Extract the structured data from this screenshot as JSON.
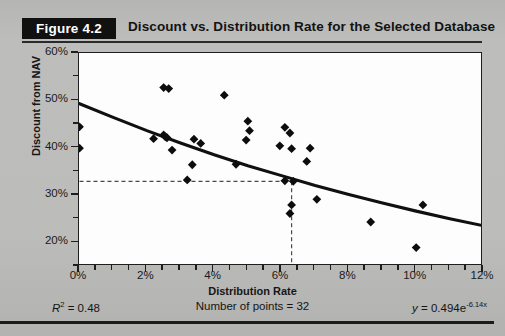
{
  "figure": {
    "badge": "Figure 4.2",
    "title": "Discount vs. Distribution Rate for the Selected Database"
  },
  "footer": {
    "r2_label": "R",
    "r2_sup": "2",
    "r2_value": " = 0.48",
    "points_label": "Number of points = 32",
    "equation_lead": "y",
    "equation_body": " = 0.494e",
    "equation_exp": "-6.14x"
  },
  "colors": {
    "badge_bg": "#111111",
    "badge_text": "#ffffff",
    "page_bg": "#b9b9b7",
    "plot_bg": "#fdfdfd",
    "axis": "#1e1e1e",
    "marker": "#0d0d0d",
    "trend": "#101010",
    "reference": "#555555"
  },
  "chart_data": {
    "type": "scatter",
    "title": "Discount vs. Distribution Rate for the Selected Database",
    "xlabel": "Distribution Rate",
    "ylabel": "Discount from NAV",
    "xlim": [
      0,
      12
    ],
    "ylim": [
      15,
      60
    ],
    "xtick_labels": [
      "0%",
      "2%",
      "4%",
      "6%",
      "8%",
      "10%",
      "12%"
    ],
    "xticks": [
      0,
      2,
      4,
      6,
      8,
      10,
      12
    ],
    "x_minor_step": 0.5,
    "ytick_labels": [
      "60%",
      "50%",
      "40%",
      "30%",
      "20%"
    ],
    "yticks": [
      60,
      50,
      40,
      30,
      20
    ],
    "y_minor_step": 5,
    "grid": false,
    "legend": "none",
    "n_points": 32,
    "r_squared": 0.48,
    "fit": {
      "type": "exponential",
      "equation": "y = 0.494e^(-6.14x)",
      "a": 0.494,
      "b": -6.14,
      "curve_points": [
        {
          "x": 0.0,
          "y": 49.4
        },
        {
          "x": 1.0,
          "y": 46.5
        },
        {
          "x": 2.0,
          "y": 43.7
        },
        {
          "x": 3.0,
          "y": 41.1
        },
        {
          "x": 4.0,
          "y": 38.6
        },
        {
          "x": 5.0,
          "y": 36.3
        },
        {
          "x": 6.0,
          "y": 34.2
        },
        {
          "x": 7.0,
          "y": 32.1
        },
        {
          "x": 8.0,
          "y": 30.2
        },
        {
          "x": 9.0,
          "y": 28.4
        },
        {
          "x": 10.0,
          "y": 26.7
        },
        {
          "x": 11.0,
          "y": 25.1
        },
        {
          "x": 12.0,
          "y": 23.6
        }
      ]
    },
    "reference_lines": {
      "horizontal_y": 33,
      "vertical_x": 6.3,
      "style": "dashed"
    },
    "points": [
      {
        "x": 0.0,
        "y": 44.5
      },
      {
        "x": 0.0,
        "y": 40.0
      },
      {
        "x": 2.5,
        "y": 52.8
      },
      {
        "x": 2.65,
        "y": 52.6
      },
      {
        "x": 2.2,
        "y": 42.0
      },
      {
        "x": 2.5,
        "y": 42.8
      },
      {
        "x": 2.55,
        "y": 42.4
      },
      {
        "x": 2.6,
        "y": 42.2
      },
      {
        "x": 2.75,
        "y": 39.6
      },
      {
        "x": 3.4,
        "y": 41.9
      },
      {
        "x": 3.6,
        "y": 41.0
      },
      {
        "x": 3.35,
        "y": 36.5
      },
      {
        "x": 3.2,
        "y": 33.3
      },
      {
        "x": 4.3,
        "y": 51.2
      },
      {
        "x": 5.0,
        "y": 45.7
      },
      {
        "x": 5.05,
        "y": 43.7
      },
      {
        "x": 4.95,
        "y": 41.7
      },
      {
        "x": 4.65,
        "y": 36.6
      },
      {
        "x": 6.1,
        "y": 44.4
      },
      {
        "x": 6.25,
        "y": 43.2
      },
      {
        "x": 5.95,
        "y": 40.5
      },
      {
        "x": 6.3,
        "y": 39.9
      },
      {
        "x": 6.85,
        "y": 40.0
      },
      {
        "x": 6.75,
        "y": 37.2
      },
      {
        "x": 6.1,
        "y": 33.1
      },
      {
        "x": 6.35,
        "y": 33.0
      },
      {
        "x": 6.3,
        "y": 28.0
      },
      {
        "x": 6.25,
        "y": 26.2
      },
      {
        "x": 7.05,
        "y": 29.2
      },
      {
        "x": 8.65,
        "y": 24.4
      },
      {
        "x": 10.2,
        "y": 28.0
      },
      {
        "x": 10.0,
        "y": 19.0
      }
    ]
  }
}
